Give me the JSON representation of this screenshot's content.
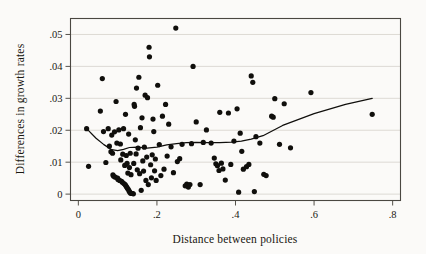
{
  "chart_data": {
    "type": "scatter",
    "title": "",
    "xlabel": "Distance between policies",
    "ylabel": "Differences in growth rates",
    "xlim": [
      -0.02,
      0.82
    ],
    "ylim": [
      -0.002,
      0.055
    ],
    "xticks": [
      0,
      0.2,
      0.4,
      0.6,
      0.8
    ],
    "xticklabels": [
      "0",
      ".2",
      ".4",
      ".6",
      ".8"
    ],
    "yticks": [
      0,
      0.01,
      0.02,
      0.03,
      0.04,
      0.05
    ],
    "yticklabels": [
      "0",
      ".01",
      ".02",
      ".03",
      ".04",
      ".05"
    ],
    "grid": "horizontal",
    "legend": "none",
    "marker_color": "#100f0c",
    "fit_color": "#100f0c",
    "grid_color": "#d9d6d0",
    "frame_color": "#4a4741",
    "background_color": "#fbfaf8",
    "marker_radius_px": 2.6,
    "points": [
      [
        0.021,
        0.0205
      ],
      [
        0.026,
        0.0087
      ],
      [
        0.056,
        0.026
      ],
      [
        0.061,
        0.0362
      ],
      [
        0.064,
        0.0196
      ],
      [
        0.07,
        0.0099
      ],
      [
        0.076,
        0.0205
      ],
      [
        0.079,
        0.015
      ],
      [
        0.083,
        0.0133
      ],
      [
        0.085,
        0.0185
      ],
      [
        0.087,
        0.0128
      ],
      [
        0.088,
        0.006
      ],
      [
        0.09,
        0.0056
      ],
      [
        0.092,
        0.0195
      ],
      [
        0.094,
        0.0053
      ],
      [
        0.096,
        0.029
      ],
      [
        0.098,
        0.016
      ],
      [
        0.1,
        0.005
      ],
      [
        0.101,
        0.0046
      ],
      [
        0.103,
        0.0201
      ],
      [
        0.105,
        0.0043
      ],
      [
        0.107,
        0.0157
      ],
      [
        0.108,
        0.0107
      ],
      [
        0.11,
        0.004
      ],
      [
        0.112,
        0.0037
      ],
      [
        0.113,
        0.0125
      ],
      [
        0.115,
        0.0205
      ],
      [
        0.116,
        0.0033
      ],
      [
        0.118,
        0.009
      ],
      [
        0.119,
        0.003
      ],
      [
        0.12,
        0.025
      ],
      [
        0.121,
        0.0026
      ],
      [
        0.122,
        0.0121
      ],
      [
        0.123,
        0.0022
      ],
      [
        0.124,
        0.0096
      ],
      [
        0.125,
        0.0018
      ],
      [
        0.126,
        0.0066
      ],
      [
        0.127,
        0.0015
      ],
      [
        0.128,
        0.0188
      ],
      [
        0.129,
        0.001
      ],
      [
        0.13,
        0.0083
      ],
      [
        0.131,
        0.0006
      ],
      [
        0.132,
        0.0128
      ],
      [
        0.133,
        0.0003
      ],
      [
        0.134,
        0.0061
      ],
      [
        0.136,
        0.0002
      ],
      [
        0.138,
        0.0002
      ],
      [
        0.14,
        0.0001
      ],
      [
        0.141,
        0.0096
      ],
      [
        0.142,
        0.0281
      ],
      [
        0.143,
        0.0275
      ],
      [
        0.145,
        0.017
      ],
      [
        0.147,
        0.0126
      ],
      [
        0.148,
        0.0332
      ],
      [
        0.15,
        0.0076
      ],
      [
        0.152,
        0.0144
      ],
      [
        0.154,
        0.0366
      ],
      [
        0.156,
        0.0064
      ],
      [
        0.158,
        0.0208
      ],
      [
        0.16,
        0.0012
      ],
      [
        0.162,
        0.0239
      ],
      [
        0.164,
        0.0104
      ],
      [
        0.166,
        0.0072
      ],
      [
        0.168,
        0.0147
      ],
      [
        0.17,
        0.031
      ],
      [
        0.172,
        0.0043
      ],
      [
        0.174,
        0.0116
      ],
      [
        0.176,
        0.0302
      ],
      [
        0.178,
        0.003
      ],
      [
        0.18,
        0.046
      ],
      [
        0.181,
        0.043
      ],
      [
        0.184,
        0.0092
      ],
      [
        0.186,
        0.0051
      ],
      [
        0.188,
        0.0123
      ],
      [
        0.19,
        0.0235
      ],
      [
        0.192,
        0.0196
      ],
      [
        0.194,
        0.0073
      ],
      [
        0.196,
        0.011
      ],
      [
        0.198,
        0.0043
      ],
      [
        0.202,
        0.0341
      ],
      [
        0.206,
        0.0155
      ],
      [
        0.21,
        0.0058
      ],
      [
        0.214,
        0.0244
      ],
      [
        0.218,
        0.0078
      ],
      [
        0.222,
        0.0281
      ],
      [
        0.226,
        0.0119
      ],
      [
        0.23,
        0.0219
      ],
      [
        0.236,
        0.0148
      ],
      [
        0.242,
        0.0067
      ],
      [
        0.248,
        0.052
      ],
      [
        0.252,
        0.0102
      ],
      [
        0.258,
        0.0111
      ],
      [
        0.264,
        0.0156
      ],
      [
        0.272,
        0.0026
      ],
      [
        0.276,
        0.0031
      ],
      [
        0.28,
        0.0022
      ],
      [
        0.284,
        0.003
      ],
      [
        0.288,
        0.0158
      ],
      [
        0.292,
        0.04
      ],
      [
        0.3,
        0.0226
      ],
      [
        0.31,
        0.003
      ],
      [
        0.318,
        0.0162
      ],
      [
        0.326,
        0.0201
      ],
      [
        0.338,
        0.016
      ],
      [
        0.346,
        0.0113
      ],
      [
        0.35,
        0.0095
      ],
      [
        0.354,
        0.0089
      ],
      [
        0.358,
        0.0074
      ],
      [
        0.36,
        0.0256
      ],
      [
        0.364,
        0.0097
      ],
      [
        0.368,
        0.0079
      ],
      [
        0.374,
        0.0044
      ],
      [
        0.382,
        0.0254
      ],
      [
        0.388,
        0.0093
      ],
      [
        0.396,
        0.0166
      ],
      [
        0.404,
        0.0267
      ],
      [
        0.408,
        0.0006
      ],
      [
        0.412,
        0.0191
      ],
      [
        0.416,
        0.0134
      ],
      [
        0.42,
        0.0078
      ],
      [
        0.428,
        0.0086
      ],
      [
        0.434,
        0.0093
      ],
      [
        0.44,
        0.037
      ],
      [
        0.444,
        0.035
      ],
      [
        0.448,
        0.0008
      ],
      [
        0.452,
        0.018
      ],
      [
        0.462,
        0.016
      ],
      [
        0.472,
        0.0062
      ],
      [
        0.478,
        0.0058
      ],
      [
        0.492,
        0.0244
      ],
      [
        0.496,
        0.0241
      ],
      [
        0.5,
        0.0299
      ],
      [
        0.512,
        0.0156
      ],
      [
        0.524,
        0.0283
      ],
      [
        0.54,
        0.0145
      ],
      [
        0.592,
        0.0318
      ],
      [
        0.748,
        0.025
      ]
    ],
    "fit_line": {
      "name": "lowess smooth",
      "x": [
        0.021,
        0.045,
        0.065,
        0.085,
        0.1,
        0.115,
        0.13,
        0.15,
        0.175,
        0.2,
        0.225,
        0.25,
        0.275,
        0.3,
        0.33,
        0.36,
        0.39,
        0.415,
        0.44,
        0.47,
        0.52,
        0.6,
        0.68,
        0.748
      ],
      "y": [
        0.0205,
        0.0175,
        0.0155,
        0.0139,
        0.0136,
        0.014,
        0.0146,
        0.0147,
        0.0144,
        0.0147,
        0.0154,
        0.0158,
        0.0161,
        0.0162,
        0.0161,
        0.0161,
        0.0163,
        0.0166,
        0.0172,
        0.0183,
        0.0215,
        0.0252,
        0.0281,
        0.03
      ]
    }
  }
}
